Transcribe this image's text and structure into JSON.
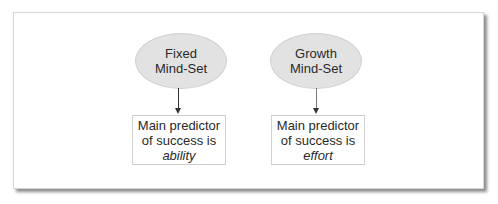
{
  "diagram": {
    "type": "flow",
    "nodes": [
      {
        "id": "fixed",
        "shape": "ellipse",
        "lines": [
          "Fixed",
          "Mind-Set"
        ],
        "target": {
          "lines": [
            "Main predictor",
            "of success is"
          ],
          "emphasis": "ability"
        }
      },
      {
        "id": "growth",
        "shape": "ellipse",
        "lines": [
          "Growth",
          "Mind-Set"
        ],
        "target": {
          "lines": [
            "Main predictor",
            "of success is"
          ],
          "emphasis": "effort"
        }
      }
    ],
    "edges": [
      {
        "from": "Fixed Mind-Set",
        "to": "Main predictor of success is ability"
      },
      {
        "from": "Growth Mind-Set",
        "to": "Main predictor of success is effort"
      }
    ],
    "colors": {
      "ellipse_fill": "#e2e2e2",
      "box_border": "#cfcfcf",
      "arrow": "#333333",
      "frame_shadow": "#777777"
    }
  }
}
